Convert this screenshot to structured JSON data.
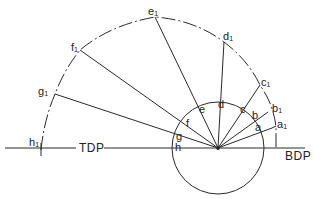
{
  "diagram": {
    "axis_labels": {
      "left": "TDP",
      "right": "BDP"
    },
    "inner_labels": [
      "a",
      "b",
      "c",
      "d",
      "e",
      "f",
      "g",
      "h"
    ],
    "outer_labels": [
      {
        "base": "a",
        "sub": "1"
      },
      {
        "base": "b",
        "sub": "1"
      },
      {
        "base": "c",
        "sub": "1"
      },
      {
        "base": "d",
        "sub": "1"
      },
      {
        "base": "e",
        "sub": "1"
      },
      {
        "base": "f",
        "sub": "1"
      },
      {
        "base": "g",
        "sub": "1"
      },
      {
        "base": "h",
        "sub": "1"
      }
    ],
    "colors": {
      "line": "#2a2a2a",
      "background": "#ffffff"
    }
  }
}
